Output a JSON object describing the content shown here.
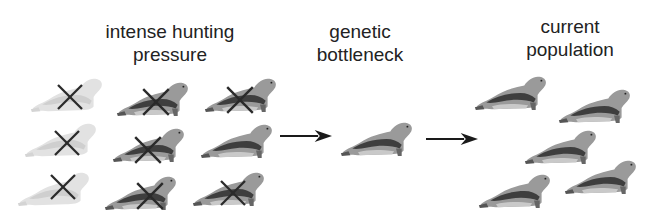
{
  "labels": {
    "hunting": {
      "line1": "intense hunting",
      "line2": "pressure"
    },
    "bottleneck": {
      "line1": "genetic",
      "line2": "bottleneck"
    },
    "current": {
      "line1": "current",
      "line2": "population"
    }
  },
  "stages": [
    {
      "id": "hunting",
      "seal_count": 9,
      "killed_count": 8,
      "survivor_count": 1
    },
    {
      "id": "bottleneck",
      "seal_count": 1
    },
    {
      "id": "current",
      "seal_count": 5
    }
  ],
  "colors": {
    "text": "#222222",
    "seal_dark": "#4a4a4a",
    "seal_mid": "#8a8a8a",
    "seal_light": "#c8c8c8",
    "faded_seal": "#d9d9d9",
    "cross": "#2a2a2a",
    "arrow": "#1a1a1a"
  }
}
